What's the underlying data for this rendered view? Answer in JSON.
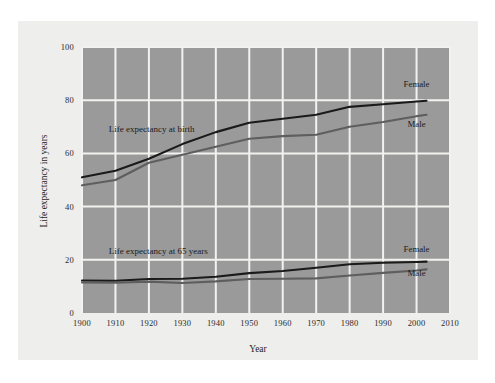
{
  "chart_data": {
    "type": "line",
    "title": "",
    "xlabel": "Year",
    "ylabel": "Life expectancy in years",
    "xlim": [
      1900,
      2010
    ],
    "ylim": [
      0,
      100
    ],
    "grid": true,
    "legend_position": "inline-right",
    "plot_background": "#9a9a9a",
    "gridline_color": "#f2f2f0",
    "xticks": [
      "1900",
      "1910",
      "1920",
      "1930",
      "1940",
      "1950",
      "1960",
      "1970",
      "1980",
      "1990",
      "2000",
      "2010"
    ],
    "yticks": [
      "0",
      "20",
      "40",
      "60",
      "80",
      "100"
    ],
    "annotations": [
      {
        "text": "Life expectancy at birth",
        "x": 1908,
        "y": 68
      },
      {
        "text": "Life expectancy at 65 years",
        "x": 1908,
        "y": 22
      }
    ],
    "series": [
      {
        "name": "Female",
        "group": "Life expectancy at birth",
        "color": "#1a1a1a",
        "label_x": 2000,
        "label_y": 85,
        "x": [
          1900,
          1910,
          1920,
          1930,
          1940,
          1950,
          1960,
          1970,
          1980,
          1990,
          2000,
          2003
        ],
        "values": [
          51.0,
          53.5,
          58.0,
          63.5,
          68.0,
          71.5,
          73.0,
          74.5,
          77.5,
          78.5,
          79.5,
          79.8
        ]
      },
      {
        "name": "Male",
        "group": "Life expectancy at birth",
        "color": "#5e5e5e",
        "label_x": 2000,
        "label_y": 70,
        "x": [
          1900,
          1910,
          1920,
          1930,
          1940,
          1950,
          1960,
          1970,
          1980,
          1990,
          2000,
          2003
        ],
        "values": [
          48.0,
          50.0,
          56.5,
          59.5,
          62.5,
          65.5,
          66.5,
          67.0,
          70.0,
          71.8,
          74.0,
          74.5
        ]
      },
      {
        "name": "Female",
        "group": "Life expectancy at 65 years",
        "color": "#1a1a1a",
        "label_x": 2000,
        "label_y": 23,
        "x": [
          1900,
          1910,
          1920,
          1930,
          1940,
          1950,
          1960,
          1970,
          1980,
          1990,
          2000,
          2003
        ],
        "values": [
          12.2,
          12.1,
          12.8,
          12.9,
          13.6,
          15.0,
          15.8,
          17.0,
          18.3,
          18.9,
          19.2,
          19.3
        ]
      },
      {
        "name": "Male",
        "group": "Life expectancy at 65 years",
        "color": "#5e5e5e",
        "label_x": 2000,
        "label_y": 14,
        "x": [
          1900,
          1910,
          1920,
          1930,
          1940,
          1950,
          1960,
          1970,
          1980,
          1990,
          2000,
          2003
        ],
        "values": [
          11.5,
          11.4,
          11.8,
          11.3,
          11.9,
          12.8,
          12.9,
          13.0,
          14.1,
          15.1,
          16.0,
          16.4
        ]
      }
    ]
  },
  "axis": {
    "x_title": "Year",
    "y_title": "Life expectancy in years"
  }
}
